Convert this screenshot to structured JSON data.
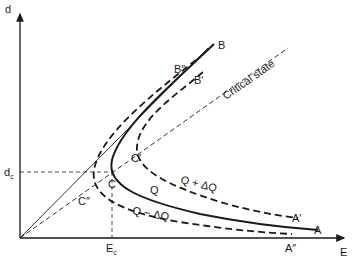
{
  "diagram": {
    "type": "phase-plane",
    "axes": {
      "x_label": "E",
      "y_label": "d",
      "x_marker": {
        "main": "E",
        "sub": "c"
      },
      "y_marker": {
        "main": "d",
        "sub": "c"
      }
    },
    "reference_lines": {
      "critical_state_label": "Critical state"
    },
    "curves": [
      {
        "name": "Q",
        "style": "solid",
        "label": "Q",
        "end_upper": "B",
        "end_lower": "A",
        "turning_point": "C"
      },
      {
        "name": "Q + ΔQ",
        "style": "dashed",
        "label": "Q + ΔQ",
        "end_upper": "B′",
        "end_lower": "A′",
        "turning_point": "C′"
      },
      {
        "name": "Q − ΔQ",
        "style": "dashed",
        "label": "Q − ΔQ",
        "end_upper": "B″",
        "end_lower": "A″",
        "turning_point": "C″"
      }
    ],
    "point_labels": {
      "B": "B",
      "B1": "B′",
      "B2": "B″",
      "A": "A",
      "A1": "A′",
      "A2": "A″",
      "C": "C",
      "C1": "C′",
      "C2": "C″",
      "Q": "Q",
      "Qplus": "Q + ΔQ",
      "Qminus": "Q − ΔQ"
    }
  }
}
